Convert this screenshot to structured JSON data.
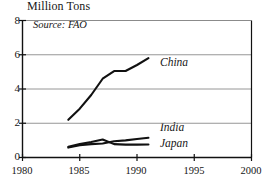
{
  "chart_data": {
    "type": "line",
    "title": "Million Tons",
    "annotation": "Source: FAO",
    "xlabel": "",
    "ylabel": "Million Tons",
    "xlim": [
      1980,
      2000
    ],
    "ylim": [
      0,
      8
    ],
    "xticks": [
      1980,
      1985,
      1990,
      1995,
      2000
    ],
    "yticks": [
      0,
      2,
      4,
      6,
      8
    ],
    "xtick_labels": [
      "1980",
      "1985",
      "1990",
      "1995",
      "2000"
    ],
    "ytick_labels": [
      "0",
      "2",
      "4",
      "6",
      "8"
    ],
    "grid": "horizontal",
    "legend_position": "inline-right",
    "line_color": "#111111",
    "grid_color": "#8a8a8a",
    "axis_color": "#111111",
    "series": [
      {
        "name": "China",
        "label": "China",
        "x": [
          1984,
          1985,
          1986,
          1987,
          1988,
          1989,
          1990,
          1991
        ],
        "values": [
          2.2,
          2.85,
          3.65,
          4.6,
          5.05,
          5.05,
          5.4,
          5.8
        ]
      },
      {
        "name": "India",
        "label": "India",
        "x": [
          1984,
          1985,
          1986,
          1987,
          1988,
          1989,
          1990,
          1991
        ],
        "values": [
          0.58,
          0.72,
          0.78,
          0.82,
          0.95,
          1.0,
          1.08,
          1.15
        ]
      },
      {
        "name": "Japan",
        "label": "Japan",
        "x": [
          1984,
          1985,
          1986,
          1987,
          1988,
          1989,
          1990,
          1991
        ],
        "values": [
          0.62,
          0.78,
          0.9,
          1.05,
          0.78,
          0.75,
          0.75,
          0.76
        ]
      }
    ]
  },
  "labels": {
    "china": "China",
    "india": "India",
    "japan": "Japan"
  }
}
